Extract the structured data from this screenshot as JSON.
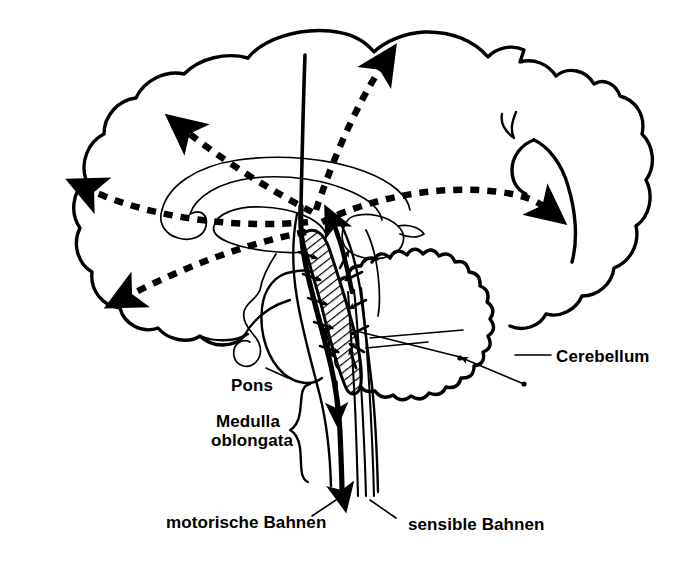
{
  "figure": {
    "background_color": "#ffffff",
    "ink_color": "#000000",
    "width": 693,
    "height": 564,
    "language": "de"
  },
  "labels": [
    {
      "id": "cerebellum",
      "text": "Cerebellum",
      "x": 556,
      "y": 362,
      "anchor": "start",
      "leader": {
        "x1": 515,
        "y1": 355,
        "x2": 551,
        "y2": 355
      }
    },
    {
      "id": "pons",
      "text": "Pons",
      "x": 231,
      "y": 391,
      "anchor": "start",
      "leader": {
        "x1": 288,
        "y1": 378,
        "x2": 268,
        "y2": 370
      }
    },
    {
      "id": "medulla-oblongata-line1",
      "text": "Medulla",
      "x": 216,
      "y": 427,
      "anchor": "start",
      "leader": null
    },
    {
      "id": "medulla-oblongata-line2",
      "text": "oblongata",
      "x": 211,
      "y": 446,
      "anchor": "start",
      "leader": null
    },
    {
      "id": "motorische-bahnen",
      "text": "motorische Bahnen",
      "x": 166,
      "y": 528,
      "anchor": "start",
      "leader": {
        "x1": 334,
        "y1": 498,
        "x2": 310,
        "y2": 515
      }
    },
    {
      "id": "sensible-bahnen",
      "text": "sensible Bahnen",
      "x": 408,
      "y": 530,
      "anchor": "start",
      "leader": {
        "x1": 372,
        "y1": 498,
        "x2": 396,
        "y2": 517
      }
    }
  ],
  "structures": [
    {
      "id": "cerebral-cortex",
      "name": "cerebral cortex outline"
    },
    {
      "id": "corpus-callosum",
      "name": "corpus callosum"
    },
    {
      "id": "thalamus",
      "name": "thalamus"
    },
    {
      "id": "pituitary-stalk",
      "name": "pituitary stalk"
    },
    {
      "id": "pons-body",
      "name": "pons"
    },
    {
      "id": "cerebellum-body",
      "name": "cerebellum"
    },
    {
      "id": "reticular-formation",
      "name": "reticular formation (hatched)"
    },
    {
      "id": "medulla-body",
      "name": "medulla oblongata"
    }
  ],
  "pathways": {
    "ascending_projections_count": 5,
    "ascending_style": "dashed",
    "motor_tract_style": "thick solid, descending",
    "sensory_tract_style": "thin parallel solid, ascending"
  },
  "medulla_brace": {
    "present": true,
    "x": 300,
    "y_top": 385,
    "y_bottom": 495
  }
}
